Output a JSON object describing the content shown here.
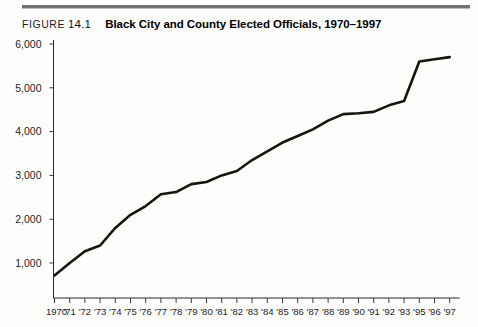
{
  "figure": {
    "label": "FIGURE",
    "number": "14.1",
    "title": "Black City and County Elected Officials, 1970–1997"
  },
  "chart_data": {
    "type": "line",
    "title": "Black City and County Elected Officials, 1970–1997",
    "xlabel": "",
    "ylabel": "",
    "grid": false,
    "legend": false,
    "ylim": [
      0,
      6000
    ],
    "yticks": [
      1000,
      2000,
      3000,
      4000,
      5000,
      6000
    ],
    "ytick_labels": [
      "1,000",
      "2,000",
      "3,000",
      "4,000",
      "5,000",
      "6,000"
    ],
    "xtick_labels": [
      "1970",
      "'71",
      "'72",
      "'73",
      "'74",
      "'75",
      "'76",
      "'77",
      "'78",
      "'79",
      "'80",
      "'81",
      "'82",
      "'83",
      "'84",
      "'85",
      "'86",
      "'87",
      "'88",
      "'89",
      "'90",
      "'91",
      "'92",
      "'93",
      "'95",
      "'96",
      "'97"
    ],
    "x": [
      "1970",
      "1971",
      "1972",
      "1973",
      "1974",
      "1975",
      "1976",
      "1977",
      "1978",
      "1979",
      "1980",
      "1981",
      "1982",
      "1983",
      "1984",
      "1985",
      "1986",
      "1987",
      "1988",
      "1989",
      "1990",
      "1991",
      "1992",
      "1993",
      "1995",
      "1996",
      "1997"
    ],
    "values": [
      715,
      1000,
      1270,
      1400,
      1800,
      2100,
      2300,
      2570,
      2620,
      2800,
      2850,
      3000,
      3100,
      3350,
      3550,
      3750,
      3900,
      4050,
      4250,
      4400,
      4420,
      4450,
      4600,
      4700,
      5600,
      5650,
      5700
    ],
    "series": [
      {
        "name": "Black City and County Elected Officials",
        "values": [
          715,
          1000,
          1270,
          1400,
          1800,
          2100,
          2300,
          2570,
          2620,
          2800,
          2850,
          3000,
          3100,
          3350,
          3550,
          3750,
          3900,
          4050,
          4250,
          4400,
          4420,
          4450,
          4600,
          4700,
          5600,
          5650,
          5700
        ]
      }
    ]
  },
  "colors": {
    "line": "#15150f",
    "axis": "#2a2a2a",
    "rule": "#6f7376",
    "text": "#1b1b1b"
  }
}
